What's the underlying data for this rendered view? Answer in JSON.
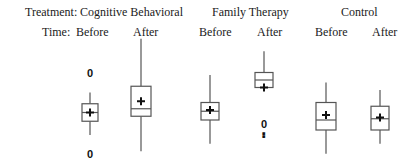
{
  "chart_data": {
    "type": "boxplot",
    "title": "",
    "xlabel": "",
    "ylabel": "",
    "value_scale_note": "No y-axis shown; values are relative on a 0-100 scale estimated from vertical position",
    "ylim": [
      0,
      100
    ],
    "grid": false,
    "header": {
      "treatment_label": "Treatment:",
      "time_label": "Time:"
    },
    "treatments": [
      {
        "name": "Cognitive Behavioral",
        "times": [
          "Before",
          "After"
        ]
      },
      {
        "name": "Family Therapy",
        "times": [
          "Before",
          "After"
        ]
      },
      {
        "name": "Control",
        "times": [
          "Before",
          "After"
        ]
      }
    ],
    "series": [
      {
        "treatment": "Cognitive Behavioral",
        "time": "Before",
        "whisker_low": 20,
        "q1": 31,
        "median": 38,
        "q3": 45,
        "whisker_high": 54,
        "mean": 38,
        "outliers": [
          {
            "value": 70,
            "label": "0"
          },
          {
            "value": 5,
            "label": "0"
          }
        ]
      },
      {
        "treatment": "Cognitive Behavioral",
        "time": "After",
        "whisker_low": 7,
        "q1": 35,
        "median": 41,
        "q3": 59,
        "whisker_high": 97,
        "mean": 47,
        "outliers": []
      },
      {
        "treatment": "Family Therapy",
        "time": "Before",
        "whisker_low": 13,
        "q1": 32,
        "median": 39,
        "q3": 46,
        "whisker_high": 68,
        "mean": 40,
        "outliers": []
      },
      {
        "treatment": "Family Therapy",
        "time": "After",
        "whisker_low": 58,
        "q1": 58,
        "median": 64,
        "q3": 70,
        "whisker_high": 87,
        "mean": 58,
        "outliers": [
          {
            "value": 29,
            "label": "0"
          },
          {
            "value": 22,
            "label": "▪"
          },
          {
            "value": 19,
            "label": "▪"
          }
        ]
      },
      {
        "treatment": "Control",
        "time": "Before",
        "whisker_low": 5,
        "q1": 24,
        "median": 32,
        "q3": 46,
        "whisker_high": 62,
        "mean": 36,
        "outliers": []
      },
      {
        "treatment": "Control",
        "time": "After",
        "whisker_low": 13,
        "q1": 24,
        "median": 33,
        "q3": 43,
        "whisker_high": 56,
        "mean": 34,
        "outliers": []
      }
    ]
  }
}
